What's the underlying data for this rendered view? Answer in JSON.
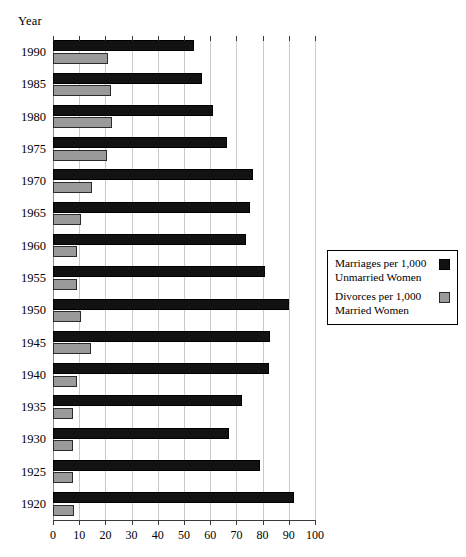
{
  "chart_data": {
    "type": "bar",
    "orientation": "horizontal",
    "title": "",
    "xlabel": "",
    "ylabel": "Year",
    "xlim": [
      0,
      100
    ],
    "xticks": [
      0,
      10,
      20,
      30,
      40,
      50,
      60,
      70,
      80,
      90,
      100
    ],
    "xtick_labels": [
      "0",
      "10",
      "20",
      "30",
      "40",
      "50",
      "60",
      "70",
      "80",
      "90",
      "100"
    ],
    "grid": true,
    "grid_axis": "x",
    "legend_position": "right",
    "categories": [
      "1990",
      "1985",
      "1980",
      "1975",
      "1970",
      "1965",
      "1960",
      "1955",
      "1950",
      "1945",
      "1940",
      "1935",
      "1930",
      "1925",
      "1920"
    ],
    "series": [
      {
        "name": "Marriages per 1,000\nUnmarried Women",
        "color": "#121212",
        "values": [
          54,
          57,
          61,
          66.5,
          76.5,
          75,
          73.5,
          81,
          90,
          83,
          82.5,
          72,
          67,
          79,
          92
        ]
      },
      {
        "name": "Divorces per 1,000\nMarried Women",
        "color": "#9a9a9a",
        "values": [
          21,
          22,
          22.5,
          20.5,
          15,
          10.5,
          9.2,
          9.3,
          10.5,
          14.5,
          9,
          7.5,
          7.5,
          7.5,
          8
        ]
      }
    ]
  },
  "axes": {
    "year_title": "Year"
  },
  "legend": {
    "entries": [
      {
        "label": "Marriages per 1,000\nUnmarried Women",
        "swatch": "marriages"
      },
      {
        "label": "Divorces per 1,000\nMarried Women",
        "swatch": "divorces"
      }
    ]
  },
  "colors": {
    "marriages": "#121212",
    "divorces": "#9a9a9a",
    "gridline": "#c9c9c9",
    "axis": "#3a3a3a",
    "background": "#ffffff"
  }
}
